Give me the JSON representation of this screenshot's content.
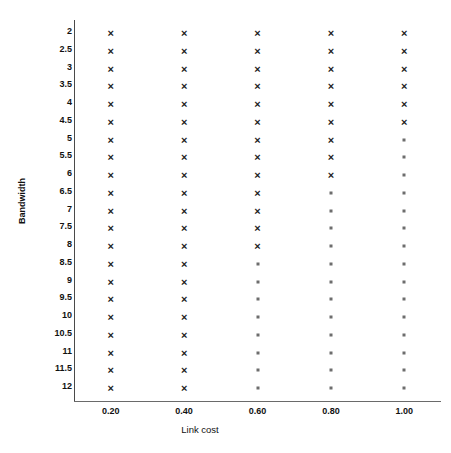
{
  "chart_data": {
    "type": "scatter",
    "title": "",
    "xlabel": "Link cost",
    "ylabel": "Bandwidth",
    "xticklabels": [
      "0.20",
      "0.40",
      "0.60",
      "0.80",
      "1.00"
    ],
    "x": [
      0.2,
      0.4,
      0.6,
      0.8,
      1.0
    ],
    "yticklabels": [
      "2",
      "2.5",
      "3",
      "3.5",
      "4",
      "4.5",
      "5",
      "5.5",
      "6",
      "6.5",
      "7",
      "7.5",
      "8",
      "8.5",
      "9",
      "9.5",
      "10",
      "10.5",
      "11",
      "11.5",
      "12"
    ],
    "y": [
      2,
      2.5,
      3,
      3.5,
      4,
      4.5,
      5,
      5.5,
      6,
      6.5,
      7,
      7.5,
      8,
      8.5,
      9,
      9.5,
      10,
      10.5,
      11,
      11.5,
      12
    ],
    "xlim": [
      0.1,
      1.1
    ],
    "ylim": [
      2,
      12
    ],
    "y_axis_inverted": true,
    "grid": false,
    "legend": "none",
    "marker_types": {
      "cross": {
        "glyph": "×",
        "name": "bold-cross-marker",
        "color": "#1c1c1c"
      },
      "dot": {
        "glyph": "",
        "name": "small-dot-marker",
        "color": "#6d6d6d"
      }
    },
    "series": [
      {
        "name": "Link cost 0.20",
        "x": 0.2,
        "points": [
          {
            "y": 2,
            "marker": "cross"
          },
          {
            "y": 2.5,
            "marker": "cross"
          },
          {
            "y": 3,
            "marker": "cross"
          },
          {
            "y": 3.5,
            "marker": "cross"
          },
          {
            "y": 4,
            "marker": "cross"
          },
          {
            "y": 4.5,
            "marker": "cross"
          },
          {
            "y": 5,
            "marker": "cross"
          },
          {
            "y": 5.5,
            "marker": "cross"
          },
          {
            "y": 6,
            "marker": "cross"
          },
          {
            "y": 6.5,
            "marker": "cross"
          },
          {
            "y": 7,
            "marker": "cross"
          },
          {
            "y": 7.5,
            "marker": "cross"
          },
          {
            "y": 8,
            "marker": "cross"
          },
          {
            "y": 8.5,
            "marker": "cross"
          },
          {
            "y": 9,
            "marker": "cross"
          },
          {
            "y": 9.5,
            "marker": "cross"
          },
          {
            "y": 10,
            "marker": "cross"
          },
          {
            "y": 10.5,
            "marker": "cross"
          },
          {
            "y": 11,
            "marker": "cross"
          },
          {
            "y": 11.5,
            "marker": "cross"
          },
          {
            "y": 12,
            "marker": "cross"
          }
        ]
      },
      {
        "name": "Link cost 0.40",
        "x": 0.4,
        "points": [
          {
            "y": 2,
            "marker": "cross"
          },
          {
            "y": 2.5,
            "marker": "cross"
          },
          {
            "y": 3,
            "marker": "cross"
          },
          {
            "y": 3.5,
            "marker": "cross"
          },
          {
            "y": 4,
            "marker": "cross"
          },
          {
            "y": 4.5,
            "marker": "cross"
          },
          {
            "y": 5,
            "marker": "cross"
          },
          {
            "y": 5.5,
            "marker": "cross"
          },
          {
            "y": 6,
            "marker": "cross"
          },
          {
            "y": 6.5,
            "marker": "cross"
          },
          {
            "y": 7,
            "marker": "cross"
          },
          {
            "y": 7.5,
            "marker": "cross"
          },
          {
            "y": 8,
            "marker": "cross"
          },
          {
            "y": 8.5,
            "marker": "cross"
          },
          {
            "y": 9,
            "marker": "cross"
          },
          {
            "y": 9.5,
            "marker": "cross"
          },
          {
            "y": 10,
            "marker": "cross"
          },
          {
            "y": 10.5,
            "marker": "cross"
          },
          {
            "y": 11,
            "marker": "cross"
          },
          {
            "y": 11.5,
            "marker": "cross"
          },
          {
            "y": 12,
            "marker": "cross"
          }
        ]
      },
      {
        "name": "Link cost 0.60",
        "x": 0.6,
        "points": [
          {
            "y": 2,
            "marker": "cross"
          },
          {
            "y": 2.5,
            "marker": "cross"
          },
          {
            "y": 3,
            "marker": "cross"
          },
          {
            "y": 3.5,
            "marker": "cross"
          },
          {
            "y": 4,
            "marker": "cross"
          },
          {
            "y": 4.5,
            "marker": "cross"
          },
          {
            "y": 5,
            "marker": "cross"
          },
          {
            "y": 5.5,
            "marker": "cross"
          },
          {
            "y": 6,
            "marker": "cross"
          },
          {
            "y": 6.5,
            "marker": "cross"
          },
          {
            "y": 7,
            "marker": "cross"
          },
          {
            "y": 7.5,
            "marker": "cross"
          },
          {
            "y": 8,
            "marker": "cross"
          },
          {
            "y": 8.5,
            "marker": "dot"
          },
          {
            "y": 9,
            "marker": "dot"
          },
          {
            "y": 9.5,
            "marker": "dot"
          },
          {
            "y": 10,
            "marker": "dot"
          },
          {
            "y": 10.5,
            "marker": "dot"
          },
          {
            "y": 11,
            "marker": "dot"
          },
          {
            "y": 11.5,
            "marker": "dot"
          },
          {
            "y": 12,
            "marker": "dot"
          }
        ]
      },
      {
        "name": "Link cost 0.80",
        "x": 0.8,
        "points": [
          {
            "y": 2,
            "marker": "cross"
          },
          {
            "y": 2.5,
            "marker": "cross"
          },
          {
            "y": 3,
            "marker": "cross"
          },
          {
            "y": 3.5,
            "marker": "cross"
          },
          {
            "y": 4,
            "marker": "cross"
          },
          {
            "y": 4.5,
            "marker": "cross"
          },
          {
            "y": 5,
            "marker": "cross"
          },
          {
            "y": 5.5,
            "marker": "cross"
          },
          {
            "y": 6,
            "marker": "cross"
          },
          {
            "y": 6.5,
            "marker": "dot"
          },
          {
            "y": 7,
            "marker": "dot"
          },
          {
            "y": 7.5,
            "marker": "dot"
          },
          {
            "y": 8,
            "marker": "dot"
          },
          {
            "y": 8.5,
            "marker": "dot"
          },
          {
            "y": 9,
            "marker": "dot"
          },
          {
            "y": 9.5,
            "marker": "dot"
          },
          {
            "y": 10,
            "marker": "dot"
          },
          {
            "y": 10.5,
            "marker": "dot"
          },
          {
            "y": 11,
            "marker": "dot"
          },
          {
            "y": 11.5,
            "marker": "dot"
          },
          {
            "y": 12,
            "marker": "dot"
          }
        ]
      },
      {
        "name": "Link cost 1.00",
        "x": 1.0,
        "points": [
          {
            "y": 2,
            "marker": "cross"
          },
          {
            "y": 2.5,
            "marker": "cross"
          },
          {
            "y": 3,
            "marker": "cross"
          },
          {
            "y": 3.5,
            "marker": "cross"
          },
          {
            "y": 4,
            "marker": "cross"
          },
          {
            "y": 4.5,
            "marker": "cross"
          },
          {
            "y": 5,
            "marker": "dot"
          },
          {
            "y": 5.5,
            "marker": "dot"
          },
          {
            "y": 6,
            "marker": "dot"
          },
          {
            "y": 6.5,
            "marker": "dot"
          },
          {
            "y": 7,
            "marker": "dot"
          },
          {
            "y": 7.5,
            "marker": "dot"
          },
          {
            "y": 8,
            "marker": "dot"
          },
          {
            "y": 8.5,
            "marker": "dot"
          },
          {
            "y": 9,
            "marker": "dot"
          },
          {
            "y": 9.5,
            "marker": "dot"
          },
          {
            "y": 10,
            "marker": "dot"
          },
          {
            "y": 10.5,
            "marker": "dot"
          },
          {
            "y": 11,
            "marker": "dot"
          },
          {
            "y": 11.5,
            "marker": "dot"
          },
          {
            "y": 12,
            "marker": "dot"
          }
        ]
      }
    ]
  },
  "axes": {
    "y_title": "Bandwidth",
    "x_title": "Link cost"
  },
  "colors": {
    "cross_marker": "#1c1c1c",
    "dot_marker": "#6d6d6d",
    "axis_line": "#4a4a4a",
    "background": "#ffffff",
    "text": "#111111"
  }
}
